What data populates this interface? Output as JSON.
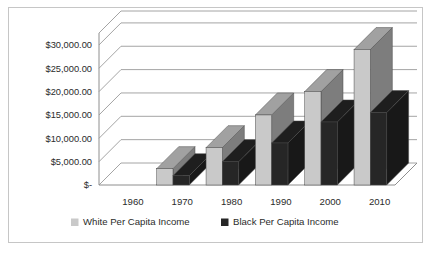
{
  "chart_data": {
    "type": "bar",
    "title": "",
    "subtitle": "",
    "xlabel": "",
    "ylabel": "",
    "categories": [
      "1960",
      "1970",
      "1980",
      "1990",
      "2000",
      "2010"
    ],
    "series": [
      {
        "name": "White Per Capita Income",
        "color": "#c9c9c9",
        "values": [
          null,
          3500,
          8000,
          15000,
          20000,
          29000
        ]
      },
      {
        "name": "Black Per Capita Income",
        "color": "#262626",
        "values": [
          null,
          2000,
          5000,
          9000,
          13500,
          15500
        ]
      }
    ],
    "ylim": [
      0,
      30000
    ],
    "ytick_step": 5000,
    "ytick_labels": [
      "$-",
      "$5,000.00",
      "$10,000.00",
      "$15,000.00",
      "$20,000.00",
      "$25,000.00",
      "$30,000.00"
    ],
    "ytick_values": [
      0,
      5000,
      10000,
      15000,
      20000,
      25000,
      30000
    ],
    "grid": true,
    "three_d": true,
    "legend_position": "bottom",
    "legend": [
      {
        "label": "White Per Capita Income",
        "swatch": "#c9c9c9"
      },
      {
        "label": "Black Per Capita Income",
        "swatch": "#262626"
      }
    ]
  },
  "frame": {
    "border_color": "#c6c6c6",
    "background": "#ffffff"
  }
}
